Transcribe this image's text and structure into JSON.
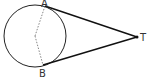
{
  "diagram": {
    "type": "circle-tangents",
    "circle": {
      "cx": 35,
      "cy": 36,
      "r": 31
    },
    "center_point": {
      "x": 35,
      "y": 36
    },
    "points": [
      {
        "id": "A",
        "label": "A",
        "x": 45,
        "y": 6,
        "label_x": 41,
        "label_y": 7
      },
      {
        "id": "B",
        "label": "B",
        "x": 43,
        "y": 65,
        "label_x": 39,
        "label_y": 77
      },
      {
        "id": "T",
        "label": "T",
        "x": 137,
        "y": 37,
        "label_x": 140,
        "label_y": 41
      }
    ],
    "segments": [
      {
        "from": "A",
        "to": "T",
        "style": "solid"
      },
      {
        "from": "B",
        "to": "T",
        "style": "solid"
      },
      {
        "from": "center",
        "to": "A",
        "style": "dashed"
      },
      {
        "from": "center",
        "to": "B",
        "style": "dashed"
      }
    ],
    "colors": {
      "stroke": "#222222",
      "dashed": "#666666",
      "label": "#333333"
    }
  }
}
